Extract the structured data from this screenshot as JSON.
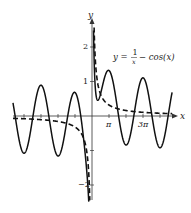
{
  "chart_data": {
    "type": "line",
    "title": "",
    "annotation": "y = 1/x − cos(x)",
    "xlabel": "x",
    "ylabel": "y",
    "xlim": [
      -14.6,
      14.8
    ],
    "ylim": [
      -2.5,
      2.6
    ],
    "grid": false,
    "legend": null,
    "x_ticks": [
      {
        "value": 3.14159,
        "label": "π"
      },
      {
        "value": 9.42478,
        "label": "3π"
      }
    ],
    "x_minor_ticks": [
      -12.566,
      -9.425,
      -6.283,
      -3.142,
      3.142,
      6.283,
      9.425,
      12.566
    ],
    "y_ticks": [
      {
        "value": 2,
        "label": "2"
      },
      {
        "value": 1,
        "label": "1"
      },
      {
        "value": -1,
        "label": ""
      },
      {
        "value": -2,
        "label": "−2"
      }
    ],
    "series": [
      {
        "name": "1/x − cos(x)",
        "style": "solid",
        "formula": "1/x - cos(x)"
      },
      {
        "name": "1/x",
        "style": "dashed",
        "formula": "1/x"
      }
    ]
  },
  "labels": {
    "y_axis": "y",
    "x_axis": "x",
    "eq_lhs": "y =",
    "eq_num": "1",
    "eq_den": "x",
    "eq_rhs": "− cos(x)",
    "tick_pi": "π",
    "tick_3pi": "3π",
    "tick_2": "2",
    "tick_1": "1",
    "tick_m2": "−2"
  }
}
